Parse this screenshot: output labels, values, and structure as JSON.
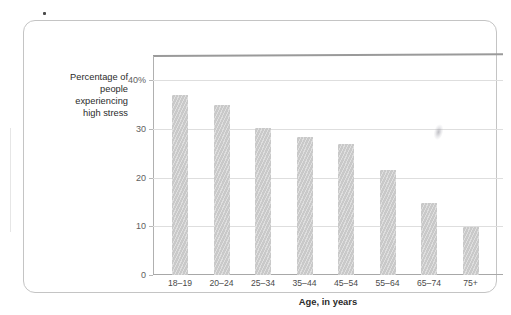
{
  "figure": {
    "y_axis_title": "Percentage of\npeople\nexperiencing\nhigh stress",
    "x_axis_title": "Age, in years"
  },
  "chart_data": {
    "type": "bar",
    "title": "",
    "xlabel": "Age, in years",
    "ylabel": "Percentage of people experiencing high stress",
    "categories": [
      "18–19",
      "20–24",
      "25–34",
      "35–44",
      "45–54",
      "55–64",
      "65–74",
      "75+"
    ],
    "values": [
      37.0,
      35.0,
      30.3,
      28.3,
      27.0,
      21.5,
      14.8,
      9.8
    ],
    "ylim": [
      0,
      45
    ],
    "yticks": [
      0,
      10,
      20,
      30,
      40
    ],
    "ytick_labels": [
      "0",
      "10",
      "20",
      "30",
      "40%"
    ],
    "grid": true,
    "legend": "none",
    "bar_color": "#c9c9c9"
  }
}
